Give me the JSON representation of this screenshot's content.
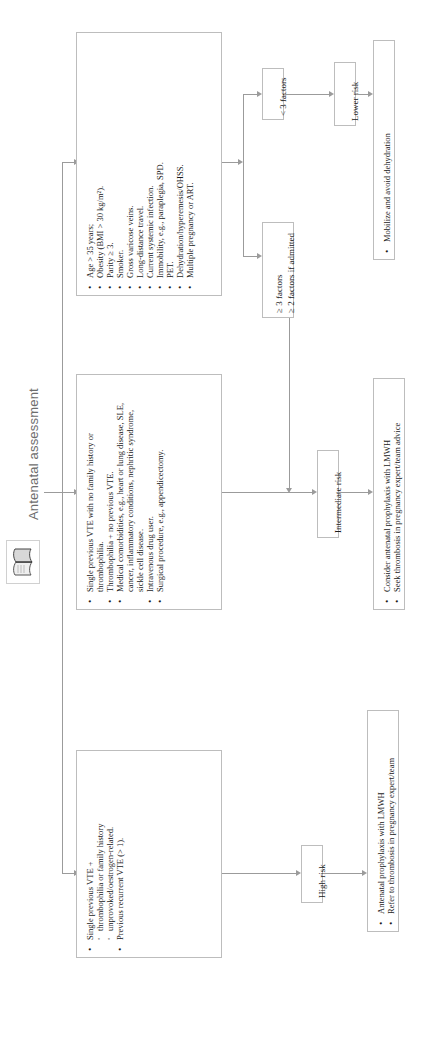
{
  "header": {
    "title": "Antenatal assessment",
    "icon": "open-book-icon"
  },
  "colors": {
    "box_border": "#bdbdbd",
    "connector": "#9b9b9b",
    "heading_text": "#6d6d6d",
    "body_text": "#1a1a1a",
    "background": "#ffffff"
  },
  "nodes": {
    "high_risk_criteria": {
      "id": "high-risk-criteria-box",
      "items": [
        {
          "level": 1,
          "text": "Single previous VTE +"
        },
        {
          "level": 2,
          "text": "thrombophilia or family history"
        },
        {
          "level": 2,
          "text": "unprovoked/oestrogen-related."
        },
        {
          "level": 1,
          "text": "Previous recurrent VTE (> 1)."
        }
      ]
    },
    "intermediate_risk_criteria": {
      "id": "intermediate-risk-criteria-box",
      "items": [
        {
          "level": 1,
          "text": "Single previous VTE with no family history or"
        },
        {
          "level": 0,
          "text": "thrombophilia."
        },
        {
          "level": 1,
          "text": "Thrombophilia + no previous VTE."
        },
        {
          "level": 1,
          "text": "Medical comorbidities, e.g., heart or lung disease, SLE,"
        },
        {
          "level": 0,
          "text": "cancer, inflammatory conditions, nephritic syndrome,"
        },
        {
          "level": 0,
          "text": "sickle cell disease."
        },
        {
          "level": 1,
          "text": "Intravenous drug user."
        },
        {
          "level": 1,
          "text": "Surgical procedure, e.g., appendicectomy."
        }
      ]
    },
    "risk_factors": {
      "id": "risk-factors-box",
      "items": [
        {
          "level": 1,
          "text": "Age > 35 years;"
        },
        {
          "level": 1,
          "text": "Obesity (BMI > 30 kg/m²)."
        },
        {
          "level": 1,
          "text": "Parity ≥ 3."
        },
        {
          "level": 1,
          "text": "Smoker."
        },
        {
          "level": 1,
          "text": "Gross varicose veins."
        },
        {
          "level": 1,
          "text": "Long-distance travel."
        },
        {
          "level": 1,
          "text": "Current systemic infection."
        },
        {
          "level": 1,
          "text": "Immobility, e.g., paraplegia, SPD."
        },
        {
          "level": 1,
          "text": "PET."
        },
        {
          "level": 1,
          "text": "Dehydration/hyperemesis/OHSS."
        },
        {
          "level": 1,
          "text": "Multiple pregnancy or ART."
        }
      ]
    },
    "lt3_factors": {
      "id": "less-than-3-factors-box",
      "label": "< 3 factors"
    },
    "ge3_factors": {
      "id": "three-or-more-factors-box",
      "line1": "≥ 3 factors",
      "line2": "≥ 2 factors if admitted"
    },
    "lower_risk": {
      "id": "lower-risk-box",
      "label": "Lower risk"
    },
    "intermediate_risk": {
      "id": "intermediate-risk-box",
      "label": "Intermediate risk"
    },
    "high_risk": {
      "id": "high-risk-box",
      "label": "High risk"
    },
    "lower_risk_action": {
      "id": "lower-risk-action-box",
      "items": [
        {
          "level": 1,
          "text": "Mobilize and avoid dehydration"
        }
      ]
    },
    "intermediate_risk_action": {
      "id": "intermediate-risk-action-box",
      "items": [
        {
          "level": 1,
          "text": "Consider antenatal prophylaxis with LMWH"
        },
        {
          "level": 1,
          "text": "Seek thrombosis in pregnancy expert/team advice"
        }
      ]
    },
    "high_risk_action": {
      "id": "high-risk-action-box",
      "items": [
        {
          "level": 1,
          "text": "Antenatal prophylaxis with LMWH"
        },
        {
          "level": 1,
          "text": "Refer to thrombosis in pregnancy expert/team"
        }
      ]
    }
  }
}
